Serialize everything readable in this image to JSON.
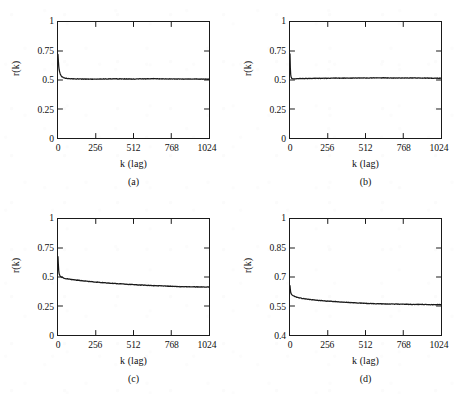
{
  "figure": {
    "background_color": "#ffffff",
    "ink_color": "#1a1a1a",
    "panel_count": 4
  },
  "chart_data": [
    {
      "type": "line",
      "panel": "a",
      "caption": "(a)",
      "title": "",
      "xlabel": "k (lag)",
      "ylabel": "r(k)",
      "xlim": [
        0,
        1024
      ],
      "ylim": [
        0,
        1
      ],
      "xticks": [
        0,
        256,
        512,
        768,
        1024
      ],
      "xticklabels": [
        "0",
        "256",
        "512",
        "768",
        "1024"
      ],
      "yticks": [
        0,
        0.25,
        0.5,
        0.75,
        1
      ],
      "yticklabels": [
        "0",
        "0.25",
        "0.5",
        "0.75",
        "1"
      ],
      "grid": false,
      "legend": null,
      "series": [
        {
          "name": "r(k)",
          "x": [
            0,
            4,
            8,
            16,
            24,
            32,
            48,
            64,
            96,
            128,
            192,
            256,
            320,
            384,
            448,
            512,
            576,
            640,
            704,
            768,
            832,
            896,
            960,
            1024
          ],
          "values": [
            0.72,
            0.63,
            0.585,
            0.548,
            0.532,
            0.524,
            0.516,
            0.513,
            0.51,
            0.509,
            0.508,
            0.508,
            0.509,
            0.51,
            0.509,
            0.508,
            0.51,
            0.511,
            0.51,
            0.509,
            0.508,
            0.509,
            0.508,
            0.507
          ]
        }
      ]
    },
    {
      "type": "line",
      "panel": "b",
      "caption": "(b)",
      "title": "",
      "xlabel": "k (lag)",
      "ylabel": "r(k)",
      "xlim": [
        0,
        1024
      ],
      "ylim": [
        0,
        1
      ],
      "xticks": [
        0,
        256,
        512,
        768,
        1024
      ],
      "xticklabels": [
        "0",
        "256",
        "512",
        "768",
        "1024"
      ],
      "yticks": [
        0,
        0.25,
        0.5,
        0.75,
        1
      ],
      "yticklabels": [
        "0",
        "0.25",
        "0.5",
        "0.75",
        "1"
      ],
      "grid": false,
      "legend": null,
      "series": [
        {
          "name": "r(k)",
          "x": [
            0,
            2,
            4,
            8,
            12,
            16,
            24,
            32,
            64,
            128,
            192,
            256,
            320,
            384,
            448,
            512,
            576,
            640,
            704,
            768,
            832,
            896,
            960,
            1024
          ],
          "values": [
            0.725,
            0.612,
            0.552,
            0.522,
            0.514,
            0.511,
            0.51,
            0.51,
            0.512,
            0.513,
            0.514,
            0.515,
            0.516,
            0.516,
            0.517,
            0.517,
            0.518,
            0.518,
            0.517,
            0.517,
            0.518,
            0.517,
            0.516,
            0.515
          ]
        }
      ]
    },
    {
      "type": "line",
      "panel": "c",
      "caption": "(c)",
      "title": "",
      "xlabel": "k (lag)",
      "ylabel": "r(k)",
      "xlim": [
        0,
        1024
      ],
      "ylim": [
        0,
        1
      ],
      "xticks": [
        0,
        256,
        512,
        768,
        1024
      ],
      "xticklabels": [
        "0",
        "256",
        "512",
        "768",
        "1024"
      ],
      "yticks": [
        0,
        0.25,
        0.5,
        0.75,
        1
      ],
      "yticklabels": [
        "0",
        "0.25",
        "0.5",
        "0.75",
        "1"
      ],
      "grid": false,
      "legend": null,
      "series": [
        {
          "name": "r(k)",
          "x": [
            0,
            4,
            8,
            16,
            24,
            32,
            48,
            64,
            96,
            128,
            192,
            256,
            320,
            384,
            448,
            512,
            576,
            640,
            704,
            768,
            832,
            896,
            960,
            1024
          ],
          "values": [
            0.675,
            0.565,
            0.525,
            0.505,
            0.498,
            0.494,
            0.488,
            0.484,
            0.478,
            0.473,
            0.464,
            0.456,
            0.45,
            0.444,
            0.439,
            0.434,
            0.43,
            0.426,
            0.423,
            0.42,
            0.417,
            0.415,
            0.414,
            0.413
          ]
        }
      ]
    },
    {
      "type": "line",
      "panel": "d",
      "caption": "(d)",
      "title": "",
      "xlabel": "k (lag)",
      "ylabel": "r(k)",
      "xlim": [
        0,
        1024
      ],
      "ylim": [
        0.4,
        1
      ],
      "xticks": [
        0,
        256,
        512,
        768,
        1024
      ],
      "xticklabels": [
        "0",
        "256",
        "512",
        "768",
        "1024"
      ],
      "yticks": [
        0.4,
        0.55,
        0.7,
        0.85,
        1
      ],
      "yticklabels": [
        "0.4",
        "0.55",
        "0.7",
        "0.85",
        "1"
      ],
      "grid": false,
      "legend": null,
      "series": [
        {
          "name": "r(k)",
          "x": [
            0,
            4,
            8,
            16,
            24,
            32,
            48,
            64,
            96,
            128,
            192,
            256,
            320,
            384,
            448,
            512,
            576,
            640,
            704,
            768,
            832,
            896,
            960,
            1024
          ],
          "values": [
            0.655,
            0.622,
            0.612,
            0.606,
            0.602,
            0.599,
            0.595,
            0.592,
            0.588,
            0.584,
            0.579,
            0.575,
            0.572,
            0.569,
            0.566,
            0.564,
            0.562,
            0.561,
            0.56,
            0.559,
            0.558,
            0.558,
            0.557,
            0.557
          ]
        }
      ]
    }
  ]
}
